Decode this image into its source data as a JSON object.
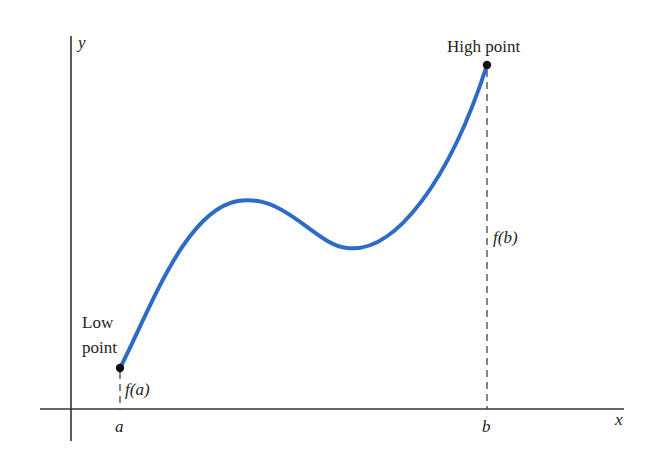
{
  "diagram": {
    "axes": {
      "x_label": "x",
      "y_label": "y"
    },
    "points": {
      "low": {
        "label_line1": "Low",
        "label_line2": "point",
        "x_label": "a",
        "value_label": "f(a)"
      },
      "high": {
        "label": "High point",
        "x_label": "b",
        "value_label": "f(b)"
      }
    },
    "colors": {
      "curve": "#2e6bc4",
      "axis": "#333333",
      "dashed": "#444444",
      "point": "#111111"
    }
  }
}
